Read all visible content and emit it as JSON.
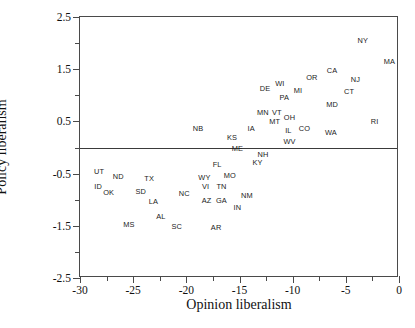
{
  "chart_data": {
    "type": "scatter",
    "title": "",
    "xlabel": "Opinion liberalism",
    "ylabel": "Policy liberalism",
    "xlim": [
      -30,
      0
    ],
    "ylim": [
      -2.5,
      2.5
    ],
    "grid": false,
    "legend": null,
    "xticks": [
      -30,
      -25,
      -20,
      -15,
      -10,
      -5,
      0
    ],
    "xtick_labels": [
      "-30",
      "-25",
      "-20",
      "-15",
      "-10",
      "-5",
      "0"
    ],
    "xminor_ticks": [
      -27.5,
      -22.5,
      -17.5,
      -12.5,
      -7.5,
      -2.5
    ],
    "yticks": [
      2.5,
      1.5,
      0.5,
      -0.5,
      -1.5,
      -2.5
    ],
    "ytick_labels": [
      "2.5",
      "1.5",
      "0.5",
      "-0.5",
      "-1.5",
      "-2.5"
    ],
    "yminor_ticks": [
      2.0,
      1.0,
      0.0,
      -1.0,
      -2.0
    ],
    "annotations": [
      {
        "label": "reference-line",
        "type": "hline",
        "y": 0.0
      }
    ],
    "marker_style": "text-label",
    "points": [
      {
        "label": "NY",
        "x": -3.4,
        "y": 2.04
      },
      {
        "label": "MA",
        "x": -0.9,
        "y": 1.64
      },
      {
        "label": "CA",
        "x": -6.3,
        "y": 1.46
      },
      {
        "label": "OR",
        "x": -8.2,
        "y": 1.34
      },
      {
        "label": "NJ",
        "x": -4.1,
        "y": 1.29
      },
      {
        "label": "WI",
        "x": -11.2,
        "y": 1.21
      },
      {
        "label": "MI",
        "x": -9.5,
        "y": 1.08
      },
      {
        "label": "DE",
        "x": -12.6,
        "y": 1.13
      },
      {
        "label": "CT",
        "x": -4.7,
        "y": 1.06
      },
      {
        "label": "PA",
        "x": -10.8,
        "y": 0.94
      },
      {
        "label": "MD",
        "x": -6.3,
        "y": 0.81
      },
      {
        "label": "MN",
        "x": -12.8,
        "y": 0.66
      },
      {
        "label": "VT",
        "x": -11.5,
        "y": 0.66
      },
      {
        "label": "OH",
        "x": -10.3,
        "y": 0.57
      },
      {
        "label": "MT",
        "x": -11.7,
        "y": 0.49
      },
      {
        "label": "RI",
        "x": -2.3,
        "y": 0.48
      },
      {
        "label": "CO",
        "x": -8.9,
        "y": 0.36
      },
      {
        "label": "IL",
        "x": -10.4,
        "y": 0.32
      },
      {
        "label": "NB",
        "x": -18.9,
        "y": 0.36
      },
      {
        "label": "IA",
        "x": -13.9,
        "y": 0.36
      },
      {
        "label": "WA",
        "x": -6.4,
        "y": 0.27
      },
      {
        "label": "KS",
        "x": -15.7,
        "y": 0.19
      },
      {
        "label": "WV",
        "x": -10.3,
        "y": 0.11
      },
      {
        "label": "ME",
        "x": -15.2,
        "y": -0.03
      },
      {
        "label": "NH",
        "x": -12.8,
        "y": -0.14
      },
      {
        "label": "KY",
        "x": -13.3,
        "y": -0.29
      },
      {
        "label": "FL",
        "x": -17.1,
        "y": -0.33
      },
      {
        "label": "UT",
        "x": -28.2,
        "y": -0.46
      },
      {
        "label": "ND",
        "x": -26.4,
        "y": -0.56
      },
      {
        "label": "TX",
        "x": -23.5,
        "y": -0.61
      },
      {
        "label": "MO",
        "x": -15.9,
        "y": -0.54
      },
      {
        "label": "WY",
        "x": -18.3,
        "y": -0.58
      },
      {
        "label": "VI",
        "x": -18.2,
        "y": -0.75
      },
      {
        "label": "TN",
        "x": -16.7,
        "y": -0.75
      },
      {
        "label": "ID",
        "x": -28.3,
        "y": -0.76
      },
      {
        "label": "OK",
        "x": -27.3,
        "y": -0.88
      },
      {
        "label": "SD",
        "x": -24.3,
        "y": -0.86
      },
      {
        "label": "NC",
        "x": -20.2,
        "y": -0.89
      },
      {
        "label": "NM",
        "x": -14.3,
        "y": -0.92
      },
      {
        "label": "AZ",
        "x": -18.1,
        "y": -1.02
      },
      {
        "label": "GA",
        "x": -16.7,
        "y": -1.02
      },
      {
        "label": "LA",
        "x": -23.1,
        "y": -1.04
      },
      {
        "label": "IN",
        "x": -15.2,
        "y": -1.15
      },
      {
        "label": "AL",
        "x": -22.4,
        "y": -1.34
      },
      {
        "label": "MS",
        "x": -25.4,
        "y": -1.49
      },
      {
        "label": "SC",
        "x": -20.9,
        "y": -1.53
      },
      {
        "label": "AR",
        "x": -17.2,
        "y": -1.55
      }
    ]
  }
}
